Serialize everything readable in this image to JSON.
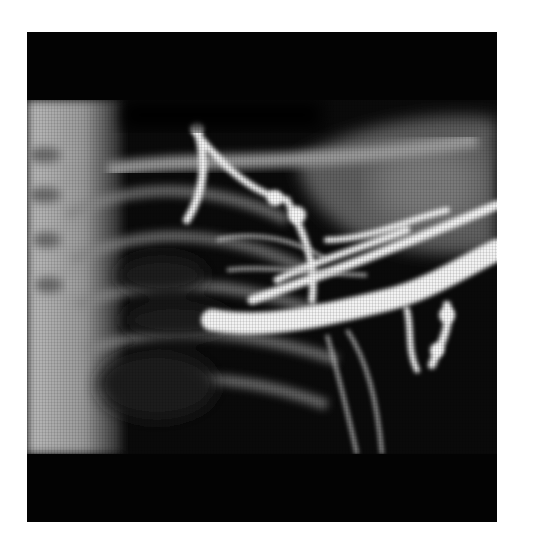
{
  "image": {
    "kind": "x-ray-venogram",
    "subject": "shoulder and upper chest with contrast-filled veins",
    "frame_color": "#030303",
    "background_color": "#ffffff"
  }
}
